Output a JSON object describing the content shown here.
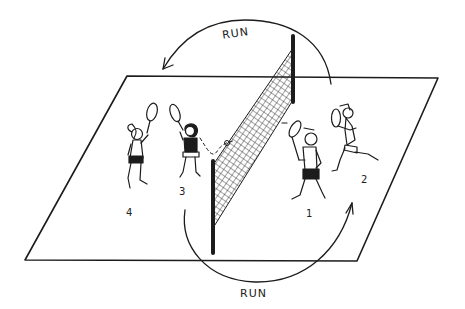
{
  "diagram": {
    "arrows": {
      "top_label": "RUN",
      "bottom_label": "RUN"
    },
    "players": [
      {
        "number": "1",
        "side": "right",
        "position": "front"
      },
      {
        "number": "2",
        "side": "right",
        "position": "back"
      },
      {
        "number": "3",
        "side": "left",
        "position": "front"
      },
      {
        "number": "4",
        "side": "left",
        "position": "back"
      }
    ],
    "colors": {
      "ink": "#1c1c1c",
      "background": "#ffffff"
    }
  }
}
